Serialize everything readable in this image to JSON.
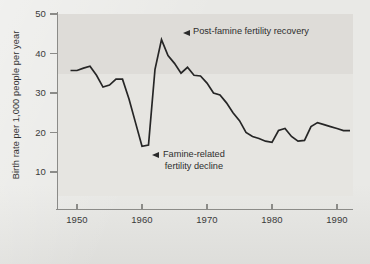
{
  "chart_data": {
    "type": "line",
    "title": "",
    "subtitle": "",
    "xlabel": "",
    "ylabel": "Birth rate per 1,000 people per year",
    "xlim": [
      1948,
      1993
    ],
    "ylim": [
      0,
      50
    ],
    "yticks": [
      50,
      40,
      30,
      20,
      10
    ],
    "xticks": [
      1950,
      1960,
      1970,
      1980,
      1990
    ],
    "grid": false,
    "legend_position": "none",
    "line_color": "#262626",
    "plot_band_color": "#dedcd8",
    "background_color": "#e9e9e6",
    "series": [
      {
        "name": "Birth rate",
        "x": [
          1949,
          1950,
          1951,
          1952,
          1953,
          1954,
          1955,
          1956,
          1957,
          1958,
          1959,
          1960,
          1961,
          1962,
          1963,
          1964,
          1965,
          1966,
          1967,
          1968,
          1969,
          1970,
          1971,
          1972,
          1973,
          1974,
          1975,
          1976,
          1977,
          1978,
          1979,
          1980,
          1981,
          1982,
          1983,
          1984,
          1985,
          1986,
          1987,
          1988,
          1989,
          1990,
          1991,
          1992
        ],
        "values": [
          35.7,
          35.7,
          36.3,
          36.8,
          34.5,
          31.5,
          32.0,
          33.5,
          33.5,
          28.5,
          22.5,
          16.5,
          16.8,
          36.0,
          43.5,
          39.5,
          37.5,
          35.0,
          36.5,
          34.5,
          34.3,
          32.5,
          30.0,
          29.5,
          27.5,
          25.0,
          23.0,
          20.0,
          19.0,
          18.5,
          17.8,
          17.5,
          20.5,
          21.0,
          19.0,
          17.8,
          18.0,
          21.5,
          22.5,
          22.0,
          21.5,
          21.0,
          20.5,
          20.5
        ]
      }
    ],
    "annotations": [
      {
        "id": "recovery",
        "text": "Post-famine fertility recovery",
        "points_to_year": 1963,
        "points_to_value": 43.5,
        "marker": "left-arrow"
      },
      {
        "id": "decline",
        "line1": "Famine-related",
        "line2": "fertility decline",
        "points_to_year": 1961,
        "points_to_value": 16.5,
        "marker": "left-arrow"
      }
    ]
  }
}
